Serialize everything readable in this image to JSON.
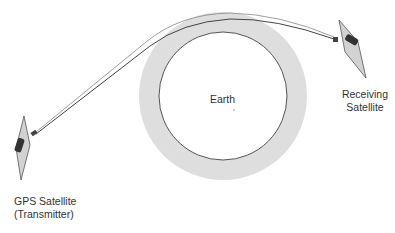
{
  "diagram": {
    "type": "gps-radio-occultation-geometry",
    "labels": {
      "earth": "Earth",
      "receiver_line1": "Receiving",
      "receiver_line2": "Satellite",
      "transmitter_line1": "GPS Satellite",
      "transmitter_line2": "(Transmitter)"
    },
    "colors": {
      "atmosphere": "#dedede",
      "earth_outline": "#555555",
      "ray": "#444444",
      "ray_secondary": "#888888",
      "panel_fill": "#cfcfcf",
      "panel_stroke": "#555555",
      "body_fill": "#3a3a3a",
      "text": "#333333"
    }
  }
}
